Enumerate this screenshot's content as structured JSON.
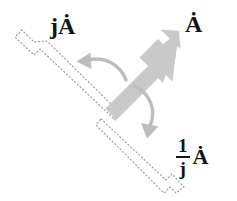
{
  "figure": {
    "background_color": "#ffffff",
    "width": 237,
    "height": 201
  },
  "colors": {
    "arrow_gray": "#c9c9c9",
    "arc_gray": "#bdbdbd",
    "dotted_gray": "#9a9a9a",
    "text_black": "#131313"
  },
  "labels": {
    "rotated_ccw": "jȦ",
    "original": "Ȧ",
    "rotated_cw_numerator": "1",
    "rotated_cw_denominator": "j",
    "rotated_cw_vector": "Ȧ"
  },
  "vectors": [
    {
      "name": "original-phasor",
      "label": "Ȧ",
      "style": "solid-filled",
      "color": "#c9c9c9",
      "angle_deg": 45,
      "tail": [
        106,
        112
      ],
      "tip": [
        178,
        34
      ]
    },
    {
      "name": "ccw-rotated-phasor",
      "label": "jȦ",
      "style": "dotted-outline",
      "color": "#9a9a9a",
      "angle_deg": 135,
      "tail": [
        106,
        112
      ],
      "tip": [
        24,
        42
      ]
    },
    {
      "name": "cw-rotated-phasor",
      "label": "1/j Ȧ",
      "style": "dotted-outline",
      "color": "#9a9a9a",
      "angle_deg": -45,
      "tail": [
        106,
        112
      ],
      "tip": [
        176,
        185
      ]
    }
  ],
  "arcs": [
    {
      "name": "ccw-rotation-arc",
      "direction": "counterclockwise",
      "color": "#bdbdbd",
      "from": [
        122,
        77
      ],
      "to": [
        82,
        64
      ]
    },
    {
      "name": "cw-rotation-arc",
      "direction": "clockwise",
      "color": "#bdbdbd",
      "from": [
        130,
        89
      ],
      "to": [
        148,
        133
      ]
    }
  ]
}
